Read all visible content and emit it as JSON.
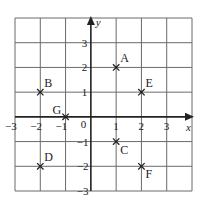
{
  "chart_data": {
    "type": "scatter",
    "title": "",
    "xlabel": "x",
    "ylabel": "y",
    "xlim": [
      -3,
      4
    ],
    "ylim": [
      -3,
      4
    ],
    "grid": true,
    "origin_label": "0",
    "x_ticks": [
      {
        "value": -3,
        "label": "−3"
      },
      {
        "value": -2,
        "label": "−2"
      },
      {
        "value": -1,
        "label": "−1"
      },
      {
        "value": 1,
        "label": "1"
      },
      {
        "value": 2,
        "label": "2"
      },
      {
        "value": 3,
        "label": "3"
      }
    ],
    "y_ticks": [
      {
        "value": 3,
        "label": "3"
      },
      {
        "value": 2,
        "label": "2"
      },
      {
        "value": 1,
        "label": "1"
      },
      {
        "value": -1,
        "label": "−1"
      },
      {
        "value": -2,
        "label": "−2"
      },
      {
        "value": -3,
        "label": "−3"
      }
    ],
    "points": [
      {
        "label": "A",
        "x": 1,
        "y": 2,
        "label_pos": "top-right"
      },
      {
        "label": "B",
        "x": -2,
        "y": 1,
        "label_pos": "top-right"
      },
      {
        "label": "C",
        "x": 1,
        "y": -1,
        "label_pos": "bottom-right"
      },
      {
        "label": "D",
        "x": -2,
        "y": -2,
        "label_pos": "top-right"
      },
      {
        "label": "E",
        "x": 2,
        "y": 1,
        "label_pos": "top-right"
      },
      {
        "label": "F",
        "x": 2,
        "y": -2,
        "label_pos": "bottom-right"
      },
      {
        "label": "G",
        "x": -1,
        "y": 0,
        "label_pos": "top-left"
      }
    ]
  }
}
